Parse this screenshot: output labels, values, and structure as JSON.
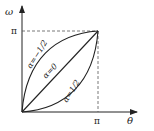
{
  "axes": {
    "x_label": "θ",
    "y_label": "ω",
    "x_tick": "π",
    "y_tick": "π"
  },
  "curves": [
    {
      "id": "alpha-neg-half",
      "label": "α=−1/2",
      "shape": "concave, above diagonal"
    },
    {
      "id": "alpha-zero",
      "label": "α=0",
      "shape": "straight diagonal"
    },
    {
      "id": "alpha-pos-half",
      "label": "α=1/2",
      "shape": "convex, below diagonal"
    }
  ],
  "colors": {
    "line": "#222222",
    "dashed": "#555555",
    "background": "#ffffff"
  }
}
